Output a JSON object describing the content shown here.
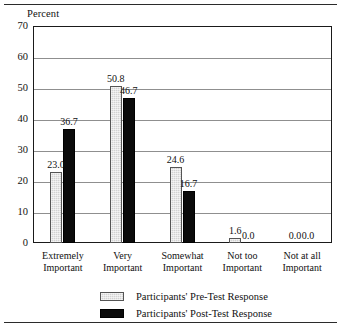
{
  "chart_data": {
    "type": "bar",
    "title": "",
    "subtitle": "",
    "xlabel": "",
    "ylabel": "Percent",
    "ylim": [
      0,
      70
    ],
    "ytick_values": [
      0,
      10,
      20,
      30,
      40,
      50,
      60,
      70
    ],
    "ytick_labels": [
      "0",
      "10",
      "20",
      "30",
      "40",
      "50",
      "60",
      "70"
    ],
    "grid": true,
    "grid_axis": "y",
    "legend_position": "bottom",
    "categories": [
      "Extremely Important",
      "Very Important",
      "Somewhat Important",
      "Not too Important",
      "Not at all Important"
    ],
    "category_lines": [
      [
        "Extremely",
        "Important"
      ],
      [
        "Very",
        "Important"
      ],
      [
        "Somewhat",
        "Important"
      ],
      [
        "Not too",
        "Important"
      ],
      [
        "Not at all",
        "Important"
      ]
    ],
    "series": [
      {
        "name": "Participants' Pre-Test Response",
        "color": "#d2d2d2",
        "values": [
          23.0,
          50.8,
          24.6,
          1.6,
          0.0
        ],
        "labels": [
          "23.0",
          "50.8",
          "24.6",
          "1.6",
          "0.0"
        ]
      },
      {
        "name": "Participants' Post-Test Response",
        "color": "#0b0b0b",
        "values": [
          36.7,
          46.7,
          16.7,
          0.0,
          0.0
        ],
        "labels": [
          "36.7",
          "46.7",
          "16.7",
          "0.0",
          "0.0"
        ]
      }
    ]
  },
  "legend": {
    "entries": [
      {
        "label": "Participants' Pre-Test Response",
        "swatch": "light-gray"
      },
      {
        "label": "Participants' Post-Test Response",
        "swatch": "black"
      }
    ]
  }
}
